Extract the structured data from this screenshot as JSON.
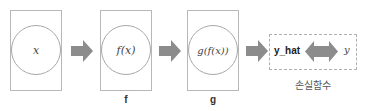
{
  "diagram": {
    "nodes": [
      {
        "id": "input",
        "expression": "x",
        "caption": ""
      },
      {
        "id": "f",
        "expression": "f(x)",
        "caption": "f"
      },
      {
        "id": "g",
        "expression": "g(f(x))",
        "caption": "g"
      }
    ],
    "loss_box": {
      "prediction": "y_hat",
      "target": "y",
      "caption": "손실함수"
    },
    "colors": {
      "arrow": "#8c8c8c",
      "box_border": "#b8b8b8",
      "circle_border": "#a8a8a8",
      "dashed_border": "#b0b0b0"
    }
  }
}
